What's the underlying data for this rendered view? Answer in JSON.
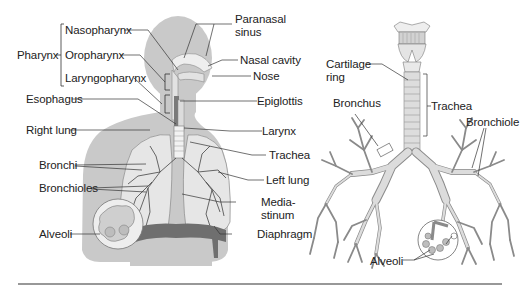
{
  "colors": {
    "silhouette": "#c9c9c9",
    "organ_fill": "#e6e6e6",
    "line": "#333333",
    "text": "#222222",
    "diaphragm": "#6f6f6f",
    "divider": "#333333"
  },
  "left_figure": {
    "title": "Respiratory system (body)",
    "group_label": "Pharynx",
    "labels": {
      "nasopharynx": "Nasopharynx",
      "oropharynx": "Oropharynx",
      "laryngopharynx": "Laryngopharynx",
      "pharynx": "Pharynx",
      "esophagus": "Esophagus",
      "right_lung": "Right lung",
      "bronchi": "Bronchi",
      "bronchioles": "Bronchioles",
      "alveoli": "Alveoli",
      "paranasal_sinus": "Paranasal\nsinus",
      "nasal_cavity": "Nasal cavity",
      "nose": "Nose",
      "epiglottis": "Epiglottis",
      "larynx": "Larynx",
      "trachea": "Trachea",
      "left_lung": "Left lung",
      "mediastinum": "Media-\nstinum",
      "diaphragm": "Diaphragm"
    }
  },
  "right_figure": {
    "title": "Bronchial tree",
    "labels": {
      "cartilage_ring": "Cartilage\nring",
      "trachea": "Trachea",
      "bronchus": "Bronchus",
      "bronchiole": "Bronchiole",
      "alveoli": "Alveoli"
    }
  }
}
